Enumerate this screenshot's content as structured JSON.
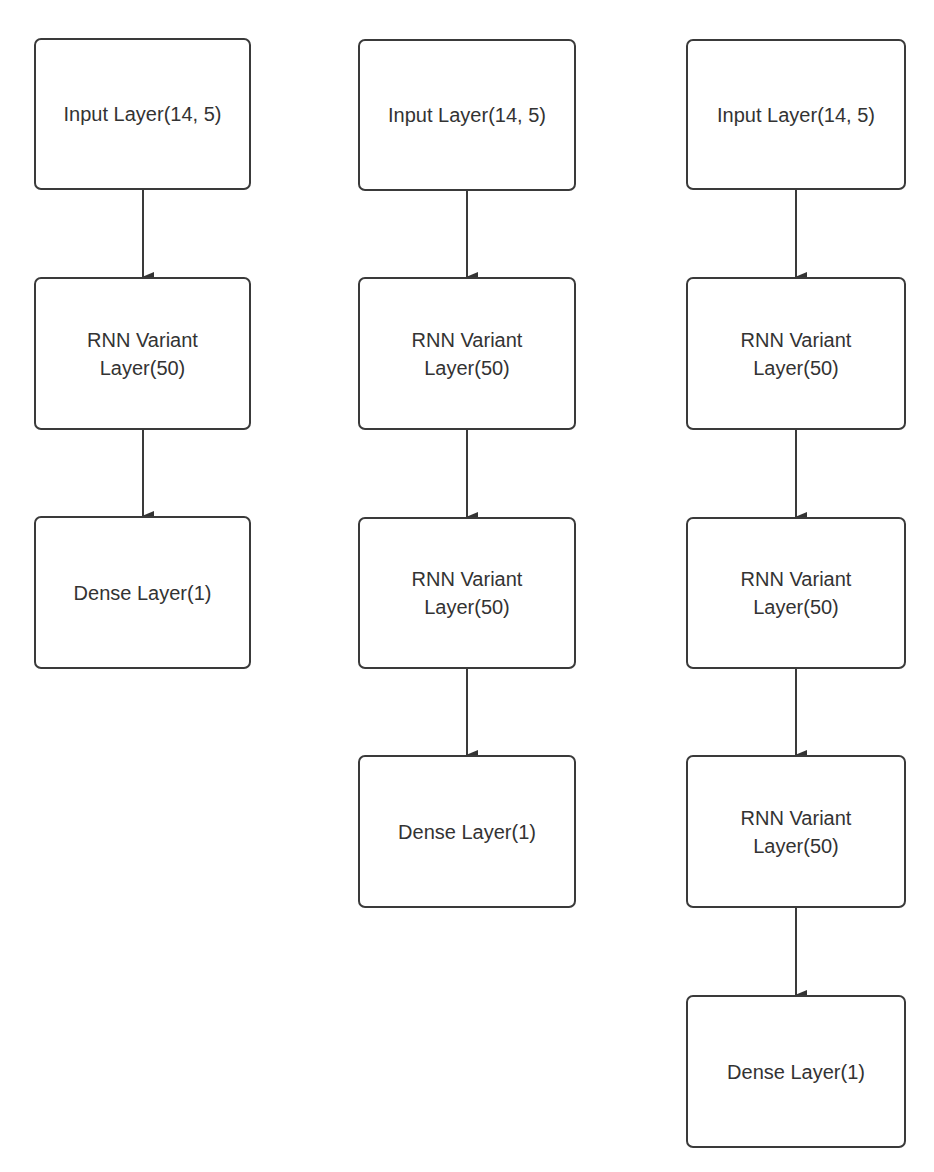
{
  "diagram": {
    "columns": [
      {
        "name": "model-1-rnn-layer",
        "nodes": [
          {
            "label": "Input Layer(14, 5)"
          },
          {
            "label": "RNN Variant Layer(50)",
            "line1": "RNN Variant",
            "line2": "Layer(50)"
          },
          {
            "label": "Dense Layer(1)"
          }
        ]
      },
      {
        "name": "model-2-rnn-layers",
        "nodes": [
          {
            "label": "Input Layer(14, 5)"
          },
          {
            "label": "RNN Variant Layer(50)",
            "line1": "RNN Variant",
            "line2": "Layer(50)"
          },
          {
            "label": "RNN Variant Layer(50)",
            "line1": "RNN Variant",
            "line2": "Layer(50)"
          },
          {
            "label": "Dense Layer(1)"
          }
        ]
      },
      {
        "name": "model-3-rnn-layers",
        "nodes": [
          {
            "label": "Input Layer(14, 5)"
          },
          {
            "label": "RNN Variant Layer(50)",
            "line1": "RNN Variant",
            "line2": "Layer(50)"
          },
          {
            "label": "RNN Variant Layer(50)",
            "line1": "RNN Variant",
            "line2": "Layer(50)"
          },
          {
            "label": "RNN Variant Layer(50)",
            "line1": "RNN Variant",
            "line2": "Layer(50)"
          },
          {
            "label": "Dense Layer(1)"
          }
        ]
      }
    ],
    "colors": {
      "stroke": "#3a3a3a",
      "text": "#333333",
      "background": "#ffffff"
    }
  }
}
